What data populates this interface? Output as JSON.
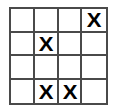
{
  "diagram": {
    "type": "grid-puzzle",
    "rows": 4,
    "columns": 4,
    "mark_symbol": "X",
    "colors": {
      "background": "#ffffff",
      "cell_fill": "#ffffff",
      "grid_line": "#4a4a4a",
      "mark": "#000000"
    },
    "cells": [
      [
        {
          "mark": ""
        },
        {
          "mark": ""
        },
        {
          "mark": ""
        },
        {
          "mark": "X"
        }
      ],
      [
        {
          "mark": ""
        },
        {
          "mark": "X"
        },
        {
          "mark": ""
        },
        {
          "mark": ""
        }
      ],
      [
        {
          "mark": ""
        },
        {
          "mark": ""
        },
        {
          "mark": ""
        },
        {
          "mark": ""
        }
      ],
      [
        {
          "mark": ""
        },
        {
          "mark": "X"
        },
        {
          "mark": "X"
        },
        {
          "mark": ""
        }
      ]
    ],
    "marked_positions": [
      {
        "row": 0,
        "column": 3
      },
      {
        "row": 1,
        "column": 1
      },
      {
        "row": 3,
        "column": 1
      },
      {
        "row": 3,
        "column": 2
      }
    ],
    "mark_count": 4
  }
}
